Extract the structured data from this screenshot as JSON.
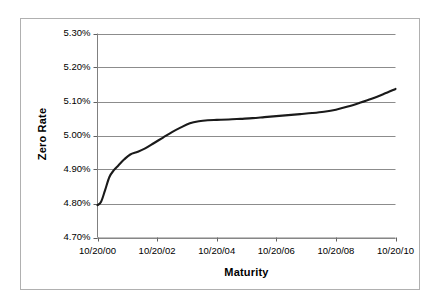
{
  "chart_data": {
    "type": "line",
    "title": "",
    "xlabel": "Maturity",
    "ylabel": "Zero Rate",
    "grid": true,
    "legend": false,
    "xtick_labels": [
      "10/20/00",
      "10/20/02",
      "10/20/04",
      "10/20/06",
      "10/20/08",
      "10/20/10"
    ],
    "ytick_labels": [
      "5.30%",
      "5.20%",
      "5.10%",
      "5.00%",
      "4.90%",
      "4.80%",
      "4.70%"
    ],
    "ylim": [
      4.7,
      5.3
    ],
    "ytick_values": [
      5.3,
      5.2,
      5.1,
      5.0,
      4.9,
      4.8,
      4.7
    ],
    "xlim": [
      0,
      10
    ],
    "xtick_values": [
      0,
      2,
      4,
      6,
      8,
      10
    ],
    "series": [
      {
        "name": "Zero Rate",
        "color": "#1a1a1a",
        "x": [
          0.0,
          0.12,
          0.25,
          0.4,
          0.55,
          0.7,
          0.9,
          1.1,
          1.35,
          1.6,
          1.9,
          2.2,
          2.5,
          2.8,
          3.1,
          3.4,
          3.7,
          4.0,
          4.4,
          4.8,
          5.2,
          5.6,
          6.0,
          6.4,
          6.8,
          7.2,
          7.6,
          8.0,
          8.4,
          8.8,
          9.2,
          9.6,
          10.0
        ],
        "y": [
          4.795,
          4.805,
          4.838,
          4.878,
          4.898,
          4.912,
          4.93,
          4.944,
          4.952,
          4.962,
          4.978,
          4.994,
          5.01,
          5.024,
          5.036,
          5.042,
          5.045,
          5.046,
          5.047,
          5.049,
          5.051,
          5.054,
          5.057,
          5.06,
          5.063,
          5.066,
          5.07,
          5.076,
          5.085,
          5.096,
          5.108,
          5.122,
          5.137
        ]
      }
    ]
  },
  "axis": {
    "ylabel": "Zero Rate",
    "xlabel": "Maturity"
  }
}
